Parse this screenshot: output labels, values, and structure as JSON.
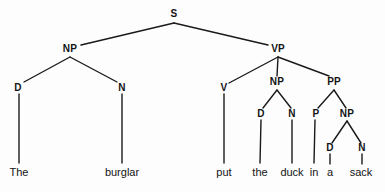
{
  "diagram": {
    "type": "syntax-tree",
    "sentence": "The burglar put the duck in a sack",
    "background_color": "#fdfdfd",
    "line_color": "#1a1a1a",
    "text_color": "#141414"
  },
  "nodes": [
    {
      "id": "s",
      "label": "S",
      "x": 174,
      "y": 14
    },
    {
      "id": "np1",
      "label": "NP",
      "x": 70,
      "y": 49
    },
    {
      "id": "vp",
      "label": "VP",
      "x": 278,
      "y": 49
    },
    {
      "id": "d1",
      "label": "D",
      "x": 18,
      "y": 88
    },
    {
      "id": "n1",
      "label": "N",
      "x": 122,
      "y": 88
    },
    {
      "id": "v",
      "label": "V",
      "x": 224,
      "y": 88
    },
    {
      "id": "np2",
      "label": "NP",
      "x": 277,
      "y": 82
    },
    {
      "id": "pp",
      "label": "PP",
      "x": 334,
      "y": 82
    },
    {
      "id": "d2",
      "label": "D",
      "x": 261,
      "y": 114
    },
    {
      "id": "n2",
      "label": "N",
      "x": 292,
      "y": 114
    },
    {
      "id": "p",
      "label": "P",
      "x": 316,
      "y": 114
    },
    {
      "id": "np3",
      "label": "NP",
      "x": 347,
      "y": 114
    },
    {
      "id": "d3",
      "label": "D",
      "x": 330,
      "y": 148
    },
    {
      "id": "n3",
      "label": "N",
      "x": 362,
      "y": 148
    }
  ],
  "leaves": [
    {
      "id": "w-the1",
      "label": "The",
      "x": 19,
      "y": 172
    },
    {
      "id": "w-burglar",
      "label": "burglar",
      "x": 122,
      "y": 172
    },
    {
      "id": "w-put",
      "label": "put",
      "x": 224,
      "y": 172
    },
    {
      "id": "w-the2",
      "label": "the",
      "x": 260,
      "y": 172
    },
    {
      "id": "w-duck",
      "label": "duck",
      "x": 292,
      "y": 172
    },
    {
      "id": "w-in",
      "label": "in",
      "x": 314,
      "y": 172
    },
    {
      "id": "w-a",
      "label": "a",
      "x": 330,
      "y": 172
    },
    {
      "id": "w-sack",
      "label": "sack",
      "x": 361,
      "y": 172
    }
  ],
  "edges": [
    {
      "id": "e-s-np1",
      "from": "s",
      "to": "np1",
      "x1": 174,
      "y1": 23,
      "x2": 81,
      "y2": 45
    },
    {
      "id": "e-s-vp",
      "from": "s",
      "to": "vp",
      "x1": 174,
      "y1": 23,
      "x2": 268,
      "y2": 45
    },
    {
      "id": "e-np1-d1",
      "from": "np1",
      "to": "d1",
      "x1": 70,
      "y1": 57,
      "x2": 24,
      "y2": 82
    },
    {
      "id": "e-np1-n1",
      "from": "np1",
      "to": "n1",
      "x1": 70,
      "y1": 57,
      "x2": 117,
      "y2": 82
    },
    {
      "id": "e-vp-v",
      "from": "vp",
      "to": "v",
      "x1": 278,
      "y1": 57,
      "x2": 229,
      "y2": 83
    },
    {
      "id": "e-vp-np2",
      "from": "vp",
      "to": "np2",
      "x1": 278,
      "y1": 57,
      "x2": 277,
      "y2": 76
    },
    {
      "id": "e-vp-pp",
      "from": "vp",
      "to": "pp",
      "x1": 278,
      "y1": 57,
      "x2": 329,
      "y2": 76
    },
    {
      "id": "e-np2-d2",
      "from": "np2",
      "to": "d2",
      "x1": 277,
      "y1": 90,
      "x2": 263,
      "y2": 108
    },
    {
      "id": "e-np2-n2",
      "from": "np2",
      "to": "n2",
      "x1": 277,
      "y1": 90,
      "x2": 291,
      "y2": 108
    },
    {
      "id": "e-pp-p",
      "from": "pp",
      "to": "p",
      "x1": 334,
      "y1": 90,
      "x2": 318,
      "y2": 108
    },
    {
      "id": "e-pp-np3",
      "from": "pp",
      "to": "np3",
      "x1": 334,
      "y1": 90,
      "x2": 346,
      "y2": 108
    },
    {
      "id": "e-np3-d3",
      "from": "np3",
      "to": "d3",
      "x1": 347,
      "y1": 121,
      "x2": 332,
      "y2": 143
    },
    {
      "id": "e-np3-n3",
      "from": "np3",
      "to": "n3",
      "x1": 347,
      "y1": 121,
      "x2": 361,
      "y2": 143
    },
    {
      "id": "e-d1-the1",
      "from": "d1",
      "to": "w-the1",
      "x1": 19,
      "y1": 94,
      "x2": 19,
      "y2": 163
    },
    {
      "id": "e-n1-burg",
      "from": "n1",
      "to": "w-burglar",
      "x1": 122,
      "y1": 94,
      "x2": 122,
      "y2": 163
    },
    {
      "id": "e-v-put",
      "from": "v",
      "to": "w-put",
      "x1": 224,
      "y1": 94,
      "x2": 224,
      "y2": 163
    },
    {
      "id": "e-d2-the2",
      "from": "d2",
      "to": "w-the2",
      "x1": 261,
      "y1": 120,
      "x2": 260,
      "y2": 163
    },
    {
      "id": "e-n2-duck",
      "from": "n2",
      "to": "w-duck",
      "x1": 292,
      "y1": 120,
      "x2": 292,
      "y2": 163
    },
    {
      "id": "e-p-in",
      "from": "p",
      "to": "w-in",
      "x1": 315,
      "y1": 120,
      "x2": 314,
      "y2": 163
    },
    {
      "id": "e-d3-a",
      "from": "d3",
      "to": "w-a",
      "x1": 330,
      "y1": 154,
      "x2": 330,
      "y2": 164
    },
    {
      "id": "e-n3-sack",
      "from": "n3",
      "to": "w-sack",
      "x1": 362,
      "y1": 154,
      "x2": 362,
      "y2": 164
    }
  ]
}
